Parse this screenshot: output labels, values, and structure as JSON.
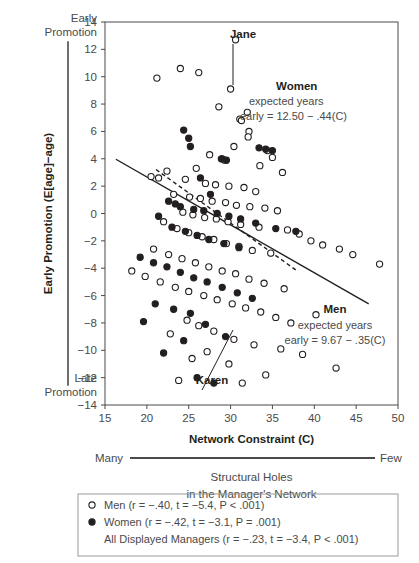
{
  "chart_data": {
    "type": "scatter",
    "title": "",
    "xlabel": "Network Constraint (C)",
    "ylabel": "Early Promotion (E[age]−age)",
    "xlim": [
      15,
      50
    ],
    "ylim": [
      -14,
      14
    ],
    "xticks": [
      15,
      20,
      25,
      30,
      35,
      40,
      45,
      50
    ],
    "yticks": [
      14,
      12,
      10,
      8,
      6,
      4,
      2,
      0,
      -2,
      -4,
      -6,
      -8,
      -10,
      -12,
      -14
    ],
    "grid": false,
    "legend_position": "below-plot",
    "axis_endpoint_labels": {
      "y_top": "Early Promotion",
      "y_bottom": "Late Promotion",
      "x_left": "Many",
      "x_right": "Few"
    },
    "x_sub_caption_line1": "Structural Holes",
    "x_sub_caption_line2": "in the Manager's Network",
    "series": [
      {
        "name": "Men",
        "marker": "open-circle",
        "points": [
          [
            30.6,
            12.7
          ],
          [
            21.2,
            9.9
          ],
          [
            24.0,
            10.6
          ],
          [
            26.2,
            10.3
          ],
          [
            30.0,
            9.1
          ],
          [
            28.6,
            7.8
          ],
          [
            32.0,
            7.4
          ],
          [
            31.1,
            6.9
          ],
          [
            31.3,
            6.8
          ],
          [
            32.2,
            6.0
          ],
          [
            32.1,
            5.6
          ],
          [
            30.4,
            4.9
          ],
          [
            27.5,
            4.3
          ],
          [
            29.0,
            4.0
          ],
          [
            29.3,
            3.9
          ],
          [
            34.4,
            4.6
          ],
          [
            35.0,
            4.1
          ],
          [
            22.4,
            3.1
          ],
          [
            20.5,
            2.7
          ],
          [
            21.4,
            2.6
          ],
          [
            24.6,
            2.5
          ],
          [
            25.9,
            3.3
          ],
          [
            33.5,
            3.5
          ],
          [
            36.2,
            3.0
          ],
          [
            27.0,
            2.2
          ],
          [
            28.2,
            2.1
          ],
          [
            29.8,
            2.0
          ],
          [
            31.6,
            1.9
          ],
          [
            33.0,
            1.6
          ],
          [
            23.2,
            1.4
          ],
          [
            25.1,
            1.2
          ],
          [
            26.4,
            1.1
          ],
          [
            27.8,
            0.9
          ],
          [
            29.4,
            0.8
          ],
          [
            30.7,
            0.6
          ],
          [
            32.3,
            0.5
          ],
          [
            34.1,
            0.4
          ],
          [
            35.6,
            0.2
          ],
          [
            24.3,
            0.1
          ],
          [
            25.5,
            -0.1
          ],
          [
            26.9,
            -0.3
          ],
          [
            28.3,
            -0.4
          ],
          [
            29.7,
            -0.6
          ],
          [
            31.2,
            -0.8
          ],
          [
            33.4,
            -1.0
          ],
          [
            36.8,
            -1.2
          ],
          [
            22.0,
            -0.6
          ],
          [
            23.6,
            -1.1
          ],
          [
            25.0,
            -1.4
          ],
          [
            26.6,
            -1.7
          ],
          [
            28.0,
            -1.9
          ],
          [
            29.5,
            -2.2
          ],
          [
            31.0,
            -2.4
          ],
          [
            32.6,
            -2.7
          ],
          [
            34.8,
            -2.9
          ],
          [
            38.2,
            -1.5
          ],
          [
            39.6,
            -2.0
          ],
          [
            20.8,
            -2.6
          ],
          [
            22.6,
            -3.0
          ],
          [
            24.2,
            -3.3
          ],
          [
            25.8,
            -3.6
          ],
          [
            27.4,
            -3.9
          ],
          [
            29.0,
            -4.2
          ],
          [
            30.6,
            -4.4
          ],
          [
            32.2,
            -4.8
          ],
          [
            34.0,
            -5.1
          ],
          [
            36.4,
            -5.5
          ],
          [
            41.0,
            -2.3
          ],
          [
            43.0,
            -2.6
          ],
          [
            44.6,
            -3.0
          ],
          [
            18.2,
            -4.2
          ],
          [
            19.8,
            -4.6
          ],
          [
            21.6,
            -5.0
          ],
          [
            23.4,
            -5.4
          ],
          [
            25.0,
            -5.7
          ],
          [
            26.8,
            -6.0
          ],
          [
            28.4,
            -6.3
          ],
          [
            30.2,
            -6.6
          ],
          [
            31.8,
            -6.9
          ],
          [
            33.6,
            -7.2
          ],
          [
            35.4,
            -7.6
          ],
          [
            37.2,
            -8.0
          ],
          [
            40.2,
            -7.4
          ],
          [
            47.8,
            -3.7
          ],
          [
            24.8,
            -7.8
          ],
          [
            26.2,
            -8.2
          ],
          [
            28.0,
            -8.6
          ],
          [
            22.8,
            -8.8
          ],
          [
            30.4,
            -9.2
          ],
          [
            32.8,
            -9.6
          ],
          [
            36.0,
            -9.9
          ],
          [
            38.6,
            -10.3
          ],
          [
            27.2,
            -10.1
          ],
          [
            25.4,
            -10.6
          ],
          [
            29.8,
            -11.0
          ],
          [
            42.6,
            -11.3
          ],
          [
            34.2,
            -11.8
          ],
          [
            31.4,
            -12.4
          ],
          [
            23.8,
            -12.2
          ]
        ]
      },
      {
        "name": "Women",
        "marker": "closed-circle",
        "points": [
          [
            33.4,
            4.8
          ],
          [
            34.2,
            4.7
          ],
          [
            35.0,
            4.6
          ],
          [
            28.9,
            4.0
          ],
          [
            29.5,
            3.9
          ],
          [
            24.4,
            6.1
          ],
          [
            25.0,
            5.5
          ],
          [
            25.2,
            4.9
          ],
          [
            26.4,
            2.6
          ],
          [
            27.6,
            1.4
          ],
          [
            22.6,
            0.9
          ],
          [
            23.4,
            0.7
          ],
          [
            24.0,
            0.5
          ],
          [
            25.6,
            0.3
          ],
          [
            26.8,
            0.2
          ],
          [
            28.4,
            0.0
          ],
          [
            29.8,
            -0.2
          ],
          [
            31.2,
            -0.4
          ],
          [
            33.0,
            -0.7
          ],
          [
            21.4,
            -0.2
          ],
          [
            23.0,
            -1.0
          ],
          [
            24.6,
            -1.3
          ],
          [
            26.0,
            -1.6
          ],
          [
            27.4,
            -1.9
          ],
          [
            29.2,
            -2.2
          ],
          [
            31.0,
            -2.5
          ],
          [
            35.4,
            -1.1
          ],
          [
            37.8,
            -1.3
          ],
          [
            19.2,
            -3.2
          ],
          [
            20.8,
            -3.6
          ],
          [
            22.4,
            -3.9
          ],
          [
            24.0,
            -4.3
          ],
          [
            25.6,
            -4.7
          ],
          [
            27.2,
            -5.0
          ],
          [
            29.0,
            -5.4
          ],
          [
            30.8,
            -5.8
          ],
          [
            32.6,
            -6.2
          ],
          [
            21.0,
            -6.6
          ],
          [
            23.2,
            -7.0
          ],
          [
            25.2,
            -7.3
          ],
          [
            19.6,
            -7.9
          ],
          [
            27.0,
            -8.1
          ],
          [
            24.4,
            -9.3
          ],
          [
            22.0,
            -10.2
          ],
          [
            29.4,
            -9.0
          ],
          [
            26.0,
            -12.0
          ],
          [
            28.0,
            -12.4
          ]
        ]
      }
    ],
    "fits": [
      {
        "name": "Men",
        "style": "solid",
        "label_head": "Men",
        "label_line1": "expected years",
        "label_line2": "early = 9.67 − .35(C)",
        "intercept": 9.67,
        "slope": -0.35,
        "x_from": 16.3,
        "x_to": 46.5
      },
      {
        "name": "Women",
        "style": "dashed",
        "label_head": "Women",
        "label_line1": "expected years",
        "label_line2": "early = 12.50 − .44(C)",
        "intercept": 12.5,
        "slope": -0.44,
        "x_from": 21.1,
        "x_to": 38.0
      }
    ],
    "annotations": [
      {
        "name": "Jane",
        "label_x": 243,
        "label_y": 38,
        "point_x": 233,
        "point_y": 85
      },
      {
        "name": "Karen",
        "label_x": 212,
        "label_y": 384,
        "point_x": 233,
        "point_y": 330
      }
    ],
    "legend": {
      "entries": [
        {
          "marker": "open-circle",
          "text": "Men (r = −.40, t = −5.4, P < .001)"
        },
        {
          "marker": "closed-circle",
          "text": "Women (r = −.42, t = −3.1, P = .001)"
        },
        {
          "marker": "none",
          "text": "All Displayed Managers (r = −.23, t = −3.4, P < .001)"
        }
      ]
    },
    "colors": {
      "ink": "#231f20",
      "axis": "#4a4a4a",
      "legend_border": "#9a9a9a",
      "background": "#ffffff"
    }
  }
}
